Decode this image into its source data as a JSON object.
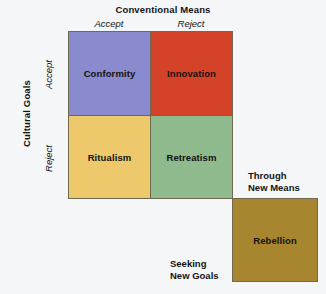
{
  "chart_data": {
    "type": "table",
    "title": "Conventional Means",
    "xlabel": "Conventional Means",
    "ylabel": "Cultural Goals",
    "x_categories": [
      "Accept",
      "Reject"
    ],
    "y_categories": [
      "Accept",
      "Reject"
    ],
    "cells": [
      {
        "label": "Conformity",
        "x": "Accept",
        "y": "Accept",
        "color": "#8a8ace"
      },
      {
        "label": "Innovation",
        "x": "Reject",
        "y": "Accept",
        "color": "#d5422a"
      },
      {
        "label": "Ritualism",
        "x": "Accept",
        "y": "Reject",
        "color": "#eec96c"
      },
      {
        "label": "Retreatism",
        "x": "Reject",
        "y": "Reject",
        "color": "#8fba8e"
      },
      {
        "label": "Rebellion",
        "x": "Through New Means",
        "y": "Seeking New Goals",
        "color": "#a8862f"
      }
    ],
    "annotations": [
      "Through New Means",
      "Seeking New Goals"
    ],
    "grid": true,
    "legend": "none"
  },
  "axes": {
    "column_title": "Conventional Means",
    "column_accept": "Accept",
    "column_reject": "Reject",
    "row_title": "Cultural Goals",
    "row_accept": "Accept",
    "row_reject": "Reject"
  },
  "quadrants": {
    "conformity": "Conformity",
    "innovation": "Innovation",
    "ritualism": "Ritualism",
    "retreatism": "Retreatism",
    "rebellion": "Rebellion"
  },
  "notes": {
    "through_new_means_line1": "Through",
    "through_new_means_line2": "New Means",
    "seeking_new_goals_line1": "Seeking",
    "seeking_new_goals_line2": "New Goals"
  },
  "colors": {
    "conformity": "#8a8ace",
    "innovation": "#d5422a",
    "ritualism": "#eec96c",
    "retreatism": "#8fba8e",
    "rebellion": "#a8862f",
    "border": "#6e6a52",
    "background": "#f4f6f8",
    "text": "#121212"
  }
}
